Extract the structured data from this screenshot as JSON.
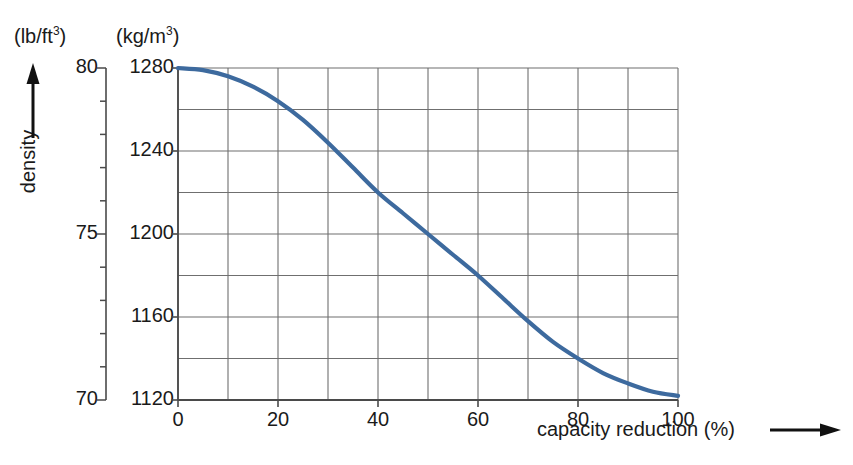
{
  "chart_data": {
    "type": "line",
    "title": "",
    "xlabel": "capacity reduction (%)",
    "ylabel": "density",
    "primary_unit": "(kg/m3)",
    "secondary_unit": "(lb/ft3)",
    "xlim": [
      0,
      100
    ],
    "ylim": [
      1120,
      1280
    ],
    "ylim_secondary": [
      70,
      80
    ],
    "grid": true,
    "legend": "none",
    "x": [
      0,
      5,
      10,
      15,
      20,
      25,
      30,
      35,
      40,
      45,
      50,
      55,
      60,
      65,
      70,
      75,
      80,
      85,
      90,
      95,
      100
    ],
    "values": [
      1280,
      1279,
      1276,
      1271,
      1264,
      1255,
      1244,
      1232,
      1220,
      1210,
      1200,
      1190,
      1180,
      1169,
      1158,
      1148,
      1140,
      1133,
      1128,
      1124,
      1122
    ],
    "series": [
      {
        "name": "density vs capacity reduction",
        "color": "#3d6a9e",
        "values": [
          1280,
          1279,
          1276,
          1271,
          1264,
          1255,
          1244,
          1232,
          1220,
          1210,
          1200,
          1190,
          1180,
          1169,
          1158,
          1148,
          1140,
          1133,
          1128,
          1124,
          1122
        ]
      }
    ]
  },
  "axes": {
    "imperial": {
      "unit_label_prefix": "(lb/ft",
      "unit_label_sup": "3",
      "unit_label_suffix": ")",
      "ticks": [
        {
          "value": 80,
          "label": "80"
        },
        {
          "value": 79,
          "label": ""
        },
        {
          "value": 78,
          "label": ""
        },
        {
          "value": 77,
          "label": ""
        },
        {
          "value": 76,
          "label": ""
        },
        {
          "value": 75,
          "label": "75"
        },
        {
          "value": 74,
          "label": ""
        },
        {
          "value": 73,
          "label": ""
        },
        {
          "value": 72,
          "label": ""
        },
        {
          "value": 71,
          "label": ""
        },
        {
          "value": 70,
          "label": "70"
        }
      ]
    },
    "metric": {
      "unit_label_prefix": "(kg/m",
      "unit_label_sup": "3",
      "unit_label_suffix": ")",
      "ticks": [
        {
          "value": 1280,
          "label": "1280"
        },
        {
          "value": 1260,
          "label": ""
        },
        {
          "value": 1240,
          "label": "1240"
        },
        {
          "value": 1220,
          "label": ""
        },
        {
          "value": 1200,
          "label": "1200"
        },
        {
          "value": 1180,
          "label": ""
        },
        {
          "value": 1160,
          "label": "1160"
        },
        {
          "value": 1140,
          "label": ""
        },
        {
          "value": 1120,
          "label": "1120"
        }
      ]
    },
    "x": {
      "title": "capacity reduction (%)",
      "ticks": [
        {
          "value": 0,
          "label": "0"
        },
        {
          "value": 10,
          "label": ""
        },
        {
          "value": 20,
          "label": "20"
        },
        {
          "value": 30,
          "label": ""
        },
        {
          "value": 40,
          "label": "40"
        },
        {
          "value": 50,
          "label": ""
        },
        {
          "value": 60,
          "label": "60"
        },
        {
          "value": 70,
          "label": ""
        },
        {
          "value": 80,
          "label": "80"
        },
        {
          "value": 90,
          "label": ""
        },
        {
          "value": 100,
          "label": "100"
        }
      ]
    },
    "y_title": "density"
  },
  "colors": {
    "curve": "#3d6a9e",
    "grid": "#6f6f6f",
    "axis": "#4a4a4a",
    "text": "#1a1a1a"
  }
}
